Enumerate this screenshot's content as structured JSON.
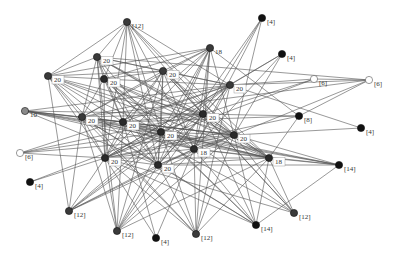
{
  "diagram": {
    "type": "network-graph",
    "nodes": [
      {
        "id": "A",
        "x": 127,
        "y": 22,
        "label": "[12]",
        "fill": "#3a3a3a",
        "boxed": false
      },
      {
        "id": "B",
        "x": 262,
        "y": 18,
        "label": "[4]",
        "fill": "#111111",
        "boxed": false
      },
      {
        "id": "C",
        "x": 97,
        "y": 57,
        "label": "20",
        "fill": "#3a3a3a",
        "boxed": true
      },
      {
        "id": "D",
        "x": 210,
        "y": 48,
        "label": "18",
        "fill": "#3a3a3a",
        "boxed": false
      },
      {
        "id": "E",
        "x": 282,
        "y": 54,
        "label": "[4]",
        "fill": "#111111",
        "boxed": false
      },
      {
        "id": "F",
        "x": 48,
        "y": 76,
        "label": "20",
        "fill": "#3a3a3a",
        "boxed": true
      },
      {
        "id": "G",
        "x": 104,
        "y": 79,
        "label": "20",
        "fill": "#2a2a2a",
        "boxed": true
      },
      {
        "id": "H",
        "x": 163,
        "y": 71,
        "label": "20",
        "fill": "#3a3a3a",
        "boxed": true
      },
      {
        "id": "I",
        "x": 230,
        "y": 85,
        "label": "20",
        "fill": "#3a3a3a",
        "boxed": true
      },
      {
        "id": "J",
        "x": 314,
        "y": 79,
        "label": "[6]",
        "fill": "#ffffff",
        "boxed": false
      },
      {
        "id": "K",
        "x": 369,
        "y": 80,
        "label": "[6]",
        "fill": "#ffffff",
        "boxed": false
      },
      {
        "id": "L",
        "x": 25,
        "y": 111,
        "label": "10",
        "fill": "#8a8a8a",
        "boxed": false
      },
      {
        "id": "M",
        "x": 82,
        "y": 117,
        "label": "20",
        "fill": "#3a3a3a",
        "boxed": true
      },
      {
        "id": "N",
        "x": 123,
        "y": 122,
        "label": "20",
        "fill": "#2a2a2a",
        "boxed": true
      },
      {
        "id": "AG",
        "x": 161,
        "y": 132,
        "label": "20",
        "fill": "#2a2a2a",
        "boxed": true
      },
      {
        "id": "O",
        "x": 203,
        "y": 114,
        "label": "20",
        "fill": "#2a2a2a",
        "boxed": true
      },
      {
        "id": "P",
        "x": 299,
        "y": 116,
        "label": "[8]",
        "fill": "#111111",
        "boxed": false
      },
      {
        "id": "Q",
        "x": 361,
        "y": 128,
        "label": "[4]",
        "fill": "#111111",
        "boxed": false
      },
      {
        "id": "R",
        "x": 20,
        "y": 153,
        "label": "[6]",
        "fill": "#ffffff",
        "boxed": false
      },
      {
        "id": "S",
        "x": 105,
        "y": 158,
        "label": "20",
        "fill": "#2a2a2a",
        "boxed": true
      },
      {
        "id": "U",
        "x": 234,
        "y": 135,
        "label": "20",
        "fill": "#2a2a2a",
        "boxed": true
      },
      {
        "id": "V",
        "x": 194,
        "y": 149,
        "label": "18",
        "fill": "#2a2a2a",
        "boxed": true
      },
      {
        "id": "T",
        "x": 158,
        "y": 165,
        "label": "20",
        "fill": "#2a2a2a",
        "boxed": true
      },
      {
        "id": "W",
        "x": 269,
        "y": 158,
        "label": "18",
        "fill": "#2a2a2a",
        "boxed": true
      },
      {
        "id": "X",
        "x": 339,
        "y": 165,
        "label": "[14]",
        "fill": "#111111",
        "boxed": false
      },
      {
        "id": "Y",
        "x": 30,
        "y": 182,
        "label": "[4]",
        "fill": "#111111",
        "boxed": false
      },
      {
        "id": "Z",
        "x": 69,
        "y": 211,
        "label": "[12]",
        "fill": "#3a3a3a",
        "boxed": false
      },
      {
        "id": "AA",
        "x": 117,
        "y": 231,
        "label": "[12]",
        "fill": "#3a3a3a",
        "boxed": false
      },
      {
        "id": "AB",
        "x": 156,
        "y": 238,
        "label": "[4]",
        "fill": "#111111",
        "boxed": false
      },
      {
        "id": "AC",
        "x": 196,
        "y": 234,
        "label": "[12]",
        "fill": "#3a3a3a",
        "boxed": false
      },
      {
        "id": "AD",
        "x": 256,
        "y": 225,
        "label": "[14]",
        "fill": "#111111",
        "boxed": false
      },
      {
        "id": "AE",
        "x": 294,
        "y": 213,
        "label": "[12]",
        "fill": "#3a3a3a",
        "boxed": false
      }
    ],
    "edges": [
      [
        "A",
        "C"
      ],
      [
        "A",
        "F"
      ],
      [
        "A",
        "G"
      ],
      [
        "A",
        "N"
      ],
      [
        "A",
        "I"
      ],
      [
        "A",
        "U"
      ],
      [
        "A",
        "O"
      ],
      [
        "A",
        "V"
      ],
      [
        "A",
        "W"
      ],
      [
        "A",
        "AG"
      ],
      [
        "A",
        "T"
      ],
      [
        "A",
        "S"
      ],
      [
        "B",
        "O"
      ],
      [
        "B",
        "U"
      ],
      [
        "B",
        "V"
      ],
      [
        "B",
        "T"
      ],
      [
        "E",
        "I"
      ],
      [
        "E",
        "S"
      ],
      [
        "E",
        "V"
      ],
      [
        "E",
        "U"
      ],
      [
        "C",
        "F"
      ],
      [
        "C",
        "G"
      ],
      [
        "C",
        "H"
      ],
      [
        "C",
        "I"
      ],
      [
        "C",
        "M"
      ],
      [
        "C",
        "N"
      ],
      [
        "C",
        "O"
      ],
      [
        "C",
        "U"
      ],
      [
        "C",
        "S"
      ],
      [
        "C",
        "T"
      ],
      [
        "C",
        "W"
      ],
      [
        "C",
        "AG"
      ],
      [
        "C",
        "K"
      ],
      [
        "C",
        "AA"
      ],
      [
        "D",
        "F"
      ],
      [
        "D",
        "G"
      ],
      [
        "D",
        "H"
      ],
      [
        "D",
        "M"
      ],
      [
        "D",
        "N"
      ],
      [
        "D",
        "O"
      ],
      [
        "D",
        "U"
      ],
      [
        "D",
        "S"
      ],
      [
        "D",
        "T"
      ],
      [
        "D",
        "V"
      ],
      [
        "D",
        "P"
      ],
      [
        "D",
        "AG"
      ],
      [
        "D",
        "AA"
      ],
      [
        "D",
        "AC"
      ],
      [
        "F",
        "G"
      ],
      [
        "F",
        "H"
      ],
      [
        "F",
        "M"
      ],
      [
        "F",
        "N"
      ],
      [
        "F",
        "S"
      ],
      [
        "F",
        "T"
      ],
      [
        "F",
        "U"
      ],
      [
        "F",
        "O"
      ],
      [
        "F",
        "W"
      ],
      [
        "F",
        "AG"
      ],
      [
        "F",
        "Z"
      ],
      [
        "F",
        "AC"
      ],
      [
        "G",
        "H"
      ],
      [
        "G",
        "I"
      ],
      [
        "G",
        "M"
      ],
      [
        "G",
        "N"
      ],
      [
        "G",
        "S"
      ],
      [
        "G",
        "T"
      ],
      [
        "G",
        "O"
      ],
      [
        "G",
        "U"
      ],
      [
        "G",
        "AG"
      ],
      [
        "G",
        "W"
      ],
      [
        "G",
        "AD"
      ],
      [
        "G",
        "AE"
      ],
      [
        "G",
        "V"
      ],
      [
        "H",
        "I"
      ],
      [
        "H",
        "N"
      ],
      [
        "H",
        "O"
      ],
      [
        "H",
        "S"
      ],
      [
        "H",
        "T"
      ],
      [
        "H",
        "U"
      ],
      [
        "H",
        "V"
      ],
      [
        "H",
        "W"
      ],
      [
        "H",
        "AG"
      ],
      [
        "H",
        "M"
      ],
      [
        "H",
        "AE"
      ],
      [
        "H",
        "AA"
      ],
      [
        "I",
        "J"
      ],
      [
        "I",
        "K"
      ],
      [
        "I",
        "M"
      ],
      [
        "I",
        "N"
      ],
      [
        "I",
        "S"
      ],
      [
        "I",
        "T"
      ],
      [
        "I",
        "O"
      ],
      [
        "I",
        "AG"
      ],
      [
        "I",
        "Q"
      ],
      [
        "I",
        "V"
      ],
      [
        "I",
        "AC"
      ],
      [
        "I",
        "Z"
      ],
      [
        "J",
        "S"
      ],
      [
        "J",
        "O"
      ],
      [
        "J",
        "K"
      ],
      [
        "K",
        "U"
      ],
      [
        "K",
        "M"
      ],
      [
        "K",
        "P"
      ],
      [
        "L",
        "N"
      ],
      [
        "L",
        "AG"
      ],
      [
        "L",
        "O"
      ],
      [
        "L",
        "U"
      ],
      [
        "L",
        "W"
      ],
      [
        "L",
        "V"
      ],
      [
        "L",
        "M"
      ],
      [
        "L",
        "I"
      ],
      [
        "L",
        "T"
      ],
      [
        "L",
        "X"
      ],
      [
        "M",
        "N"
      ],
      [
        "M",
        "S"
      ],
      [
        "M",
        "T"
      ],
      [
        "M",
        "O"
      ],
      [
        "M",
        "U"
      ],
      [
        "M",
        "AG"
      ],
      [
        "M",
        "V"
      ],
      [
        "M",
        "W"
      ],
      [
        "M",
        "AA"
      ],
      [
        "M",
        "Z"
      ],
      [
        "M",
        "AD"
      ],
      [
        "M",
        "AC"
      ],
      [
        "N",
        "O"
      ],
      [
        "N",
        "AG"
      ],
      [
        "N",
        "S"
      ],
      [
        "N",
        "T"
      ],
      [
        "N",
        "U"
      ],
      [
        "N",
        "V"
      ],
      [
        "N",
        "W"
      ],
      [
        "N",
        "P"
      ],
      [
        "N",
        "X"
      ],
      [
        "N",
        "AA"
      ],
      [
        "N",
        "AE"
      ],
      [
        "N",
        "AB"
      ],
      [
        "AG",
        "O"
      ],
      [
        "AG",
        "U"
      ],
      [
        "AG",
        "V"
      ],
      [
        "AG",
        "W"
      ],
      [
        "AG",
        "S"
      ],
      [
        "AG",
        "T"
      ],
      [
        "AG",
        "X"
      ],
      [
        "AG",
        "AD"
      ],
      [
        "AG",
        "AC"
      ],
      [
        "AG",
        "Z"
      ],
      [
        "O",
        "U"
      ],
      [
        "O",
        "S"
      ],
      [
        "O",
        "T"
      ],
      [
        "O",
        "P"
      ],
      [
        "O",
        "V"
      ],
      [
        "O",
        "W"
      ],
      [
        "O",
        "AA"
      ],
      [
        "O",
        "AE"
      ],
      [
        "O",
        "AD"
      ],
      [
        "R",
        "S"
      ],
      [
        "R",
        "O"
      ],
      [
        "R",
        "U"
      ],
      [
        "R",
        "AG"
      ],
      [
        "R",
        "I"
      ],
      [
        "Y",
        "S"
      ],
      [
        "Y",
        "AG"
      ],
      [
        "S",
        "T"
      ],
      [
        "S",
        "U"
      ],
      [
        "S",
        "V"
      ],
      [
        "S",
        "W"
      ],
      [
        "S",
        "P"
      ],
      [
        "S",
        "Z"
      ],
      [
        "S",
        "AA"
      ],
      [
        "S",
        "AB"
      ],
      [
        "S",
        "AC"
      ],
      [
        "S",
        "AD"
      ],
      [
        "S",
        "AE"
      ],
      [
        "T",
        "U"
      ],
      [
        "T",
        "V"
      ],
      [
        "T",
        "W"
      ],
      [
        "T",
        "AA"
      ],
      [
        "T",
        "AC"
      ],
      [
        "T",
        "AD"
      ],
      [
        "T",
        "X"
      ],
      [
        "T",
        "Z"
      ],
      [
        "U",
        "V"
      ],
      [
        "U",
        "W"
      ],
      [
        "U",
        "X"
      ],
      [
        "U",
        "AE"
      ],
      [
        "U",
        "AD"
      ],
      [
        "U",
        "AA"
      ],
      [
        "U",
        "AC"
      ],
      [
        "U",
        "Q"
      ],
      [
        "V",
        "W"
      ],
      [
        "V",
        "X"
      ],
      [
        "V",
        "AD"
      ],
      [
        "V",
        "AA"
      ],
      [
        "V",
        "AC"
      ],
      [
        "V",
        "AB"
      ],
      [
        "V",
        "Z"
      ],
      [
        "W",
        "X"
      ],
      [
        "W",
        "AE"
      ],
      [
        "W",
        "AD"
      ],
      [
        "W",
        "AC"
      ],
      [
        "W",
        "AA"
      ],
      [
        "W",
        "P"
      ],
      [
        "X",
        "AD"
      ],
      [
        "Z",
        "U"
      ],
      [
        "Z",
        "O"
      ]
    ]
  }
}
